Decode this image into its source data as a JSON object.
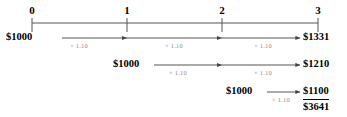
{
  "figure": {
    "background_color": "#ffffff",
    "line_color": "#555555",
    "text_color": "#000000",
    "factor_color": "#8a8a8a"
  },
  "timeline": {
    "axis_y": 23,
    "ticks": [
      {
        "label": "0",
        "x": 32
      },
      {
        "label": "1",
        "x": 127
      },
      {
        "label": "2",
        "x": 222
      },
      {
        "label": "3",
        "x": 318
      }
    ]
  },
  "rows": [
    {
      "id": "row-1",
      "start_label": "$1000",
      "start_x": 6,
      "arrow_y": 38,
      "arrow_from": 62,
      "arrow_to": 300,
      "segments": [
        {
          "factor": "× 1.10",
          "center_x": 79,
          "head_x": 127
        },
        {
          "factor": "× 1.10",
          "center_x": 174,
          "head_x": 222
        },
        {
          "factor": "× 1.10",
          "center_x": 263,
          "head_x": 300
        }
      ],
      "end_label": "$1331",
      "end_x": 303,
      "underline": false
    },
    {
      "id": "row-2",
      "start_label": "$1000",
      "start_x": 113,
      "arrow_y": 65,
      "arrow_from": 154,
      "arrow_to": 300,
      "segments": [
        {
          "factor": "× 1.10",
          "center_x": 178,
          "head_x": 222
        },
        {
          "factor": "× 1.10",
          "center_x": 263,
          "head_x": 300
        }
      ],
      "end_label": "$1210",
      "end_x": 303,
      "underline": false
    },
    {
      "id": "row-3",
      "start_label": "$1000",
      "start_x": 226,
      "arrow_y": 92,
      "arrow_from": 267,
      "arrow_to": 300,
      "segments": [
        {
          "factor": "× 1.10",
          "center_x": 281,
          "head_x": 300
        }
      ],
      "end_label": "$1100",
      "end_x": 303,
      "underline": true
    }
  ],
  "total": {
    "label": "$3641",
    "x": 303,
    "y": 102
  }
}
